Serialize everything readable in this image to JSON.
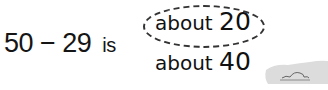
{
  "question": {
    "expression": "50 − 29",
    "verb": "is"
  },
  "options": [
    {
      "word": "about",
      "number": "20",
      "selected": true
    },
    {
      "word": "about",
      "number": "40",
      "selected": false
    }
  ],
  "colors": {
    "text": "#111111",
    "circle": "#333333",
    "rock": "#d8d8d8"
  }
}
